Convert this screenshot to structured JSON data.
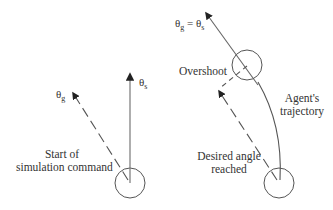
{
  "left_panel": {
    "theta_g": {
      "symbol": "θ",
      "sub": "g"
    },
    "theta_s": {
      "symbol": "θ",
      "sub": "s"
    },
    "start_label": {
      "line1": "Start of",
      "line2": "simulation command"
    }
  },
  "right_panel": {
    "equality": {
      "symbol_a": "θ",
      "sub_a": "g",
      "eq": " = ",
      "symbol_b": "θ",
      "sub_b": "s"
    },
    "overshoot_label": "Overshoot",
    "trajectory_label": {
      "line1": "Agent's",
      "line2": "trajectory"
    },
    "desired_label": {
      "line1": "Desired angle",
      "line2": "reached"
    }
  },
  "colors": {
    "stroke": "#555555",
    "text": "#333333"
  }
}
